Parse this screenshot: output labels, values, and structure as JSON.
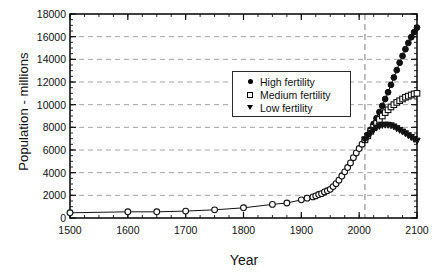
{
  "chart_data": {
    "type": "line",
    "title": "",
    "xlabel": "Year",
    "ylabel": "Population - millions",
    "xlim": [
      1500,
      2100
    ],
    "ylim": [
      0,
      18000
    ],
    "xticks": [
      1500,
      1600,
      1700,
      1800,
      1900,
      2000,
      2100
    ],
    "yticks": [
      0,
      2000,
      4000,
      6000,
      8000,
      10000,
      12000,
      14000,
      16000,
      18000
    ],
    "xtick_labels": [
      "1500",
      "1600",
      "1700",
      "1800",
      "1900",
      "2000",
      "2100"
    ],
    "ytick_labels": [
      "0",
      "2000",
      "4000",
      "6000",
      "8000",
      "10000",
      "12000",
      "14000",
      "16000",
      "18000"
    ],
    "x_minor_tick_interval": 25,
    "y_minor_tick_interval": 500,
    "grid": "horizontal-dashed",
    "legend_position": "upper-center",
    "annotations": [
      {
        "name": "projection-divider",
        "type": "vertical-dashed-line",
        "x": 2010,
        "label": ""
      }
    ],
    "series": [
      {
        "name": "Historical",
        "marker": "open-circle",
        "in_legend": false,
        "x": [
          1500,
          1600,
          1650,
          1700,
          1750,
          1800,
          1850,
          1875,
          1900,
          1910,
          1920,
          1925,
          1930,
          1935,
          1940,
          1945,
          1950,
          1955,
          1960,
          1965,
          1970,
          1975,
          1980,
          1985,
          1990,
          1995,
          2000,
          2005,
          2010
        ],
        "values": [
          460,
          545,
          545,
          610,
          720,
          900,
          1200,
          1325,
          1600,
          1750,
          1860,
          1950,
          2070,
          2150,
          2300,
          2400,
          2530,
          2770,
          3030,
          3340,
          3700,
          4070,
          4450,
          4860,
          5320,
          5740,
          6130,
          6510,
          6900
        ]
      },
      {
        "name": "High fertility",
        "marker": "filled-circle",
        "in_legend": true,
        "x": [
          2010,
          2015,
          2020,
          2025,
          2030,
          2035,
          2040,
          2045,
          2050,
          2055,
          2060,
          2065,
          2070,
          2075,
          2080,
          2085,
          2090,
          2095,
          2100
        ],
        "values": [
          6900,
          7350,
          7800,
          8300,
          8800,
          9350,
          9900,
          10500,
          11100,
          11750,
          12400,
          13050,
          13700,
          14300,
          14900,
          15450,
          15950,
          16400,
          16800
        ]
      },
      {
        "name": "Medium fertility",
        "marker": "open-square",
        "in_legend": true,
        "x": [
          2010,
          2015,
          2020,
          2025,
          2030,
          2035,
          2040,
          2045,
          2050,
          2055,
          2060,
          2065,
          2070,
          2075,
          2080,
          2085,
          2090,
          2095,
          2100
        ],
        "values": [
          6900,
          7250,
          7650,
          8000,
          8350,
          8700,
          9000,
          9300,
          9550,
          9800,
          10000,
          10200,
          10350,
          10500,
          10650,
          10750,
          10850,
          10950,
          11000
        ]
      },
      {
        "name": "Low fertility",
        "marker": "filled-triangle",
        "in_legend": true,
        "x": [
          2010,
          2015,
          2020,
          2025,
          2030,
          2035,
          2040,
          2045,
          2050,
          2055,
          2060,
          2065,
          2070,
          2075,
          2080,
          2085,
          2090,
          2095,
          2100
        ],
        "values": [
          6900,
          7200,
          7500,
          7750,
          7950,
          8100,
          8180,
          8210,
          8200,
          8150,
          8050,
          7900,
          7750,
          7600,
          7450,
          7280,
          7120,
          6950,
          6800
        ]
      }
    ]
  },
  "legend": {
    "items": [
      {
        "label": "High fertility",
        "marker": "filled-circle"
      },
      {
        "label": "Medium fertility",
        "marker": "open-square"
      },
      {
        "label": "Low fertility",
        "marker": "filled-triangle"
      }
    ]
  },
  "axes": {
    "x_title": "Year",
    "y_title": "Population - millions"
  }
}
